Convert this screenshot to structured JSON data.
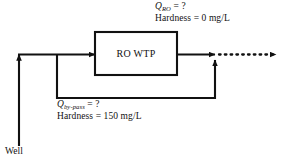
{
  "diagram": {
    "unit_box": {
      "label": "RO WTP",
      "x": 95,
      "y": 32,
      "width": 82,
      "height": 43
    },
    "source": {
      "label": "Well"
    },
    "streams": [
      {
        "id": "ro",
        "flow_symbol": "Q",
        "flow_subscript": "RO",
        "flow_value": "= ?",
        "flow_text": "Q_RO = ?",
        "hardness_label": "Hardness",
        "hardness_value": "0",
        "hardness_units": "mg/L",
        "hardness_text": "Hardness = 0 mg/L"
      },
      {
        "id": "by-pass",
        "flow_symbol": "Q",
        "flow_subscript": "by-pass",
        "flow_value": "= ?",
        "flow_text": "Q_by-pass = ?",
        "hardness_label": "Hardness",
        "hardness_value": "150",
        "hardness_units": "mg/L",
        "hardness_text": "Hardness = 150 mg/L"
      }
    ],
    "equals": "=",
    "question": "?",
    "colors": {
      "line": "#111111",
      "background": "#ffffff",
      "text": "#111111"
    }
  }
}
